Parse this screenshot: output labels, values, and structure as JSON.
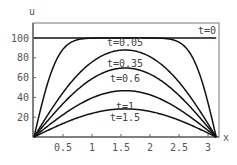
{
  "chart_data": {
    "type": "line",
    "title": "",
    "xlabel": "x",
    "ylabel": "u",
    "xlim": [
      0,
      3.14159
    ],
    "ylim": [
      0,
      113
    ],
    "x_ticks": [
      0.5,
      1,
      1.5,
      2,
      2.5,
      3
    ],
    "x_tick_labels": [
      "0.5",
      "1",
      "1.5",
      "2",
      "2.5",
      "3"
    ],
    "y_ticks": [
      20,
      40,
      60,
      80,
      100
    ],
    "y_tick_labels": [
      "20",
      "40",
      "60",
      "80",
      "100"
    ],
    "grid": false,
    "model": "u(x,t) = (400/pi) * sum over odd n of sin(n x) exp(-n^2 t) / n",
    "initial_value": 100,
    "series": [
      {
        "name": "t=0",
        "t": 0,
        "label": "t=0",
        "peak": 100
      },
      {
        "name": "t=0.05",
        "t": 0.05,
        "label": "t=0.05",
        "peak": 100
      },
      {
        "name": "t=0.35",
        "t": 0.35,
        "label": "t=0.35",
        "peak": 88
      },
      {
        "name": "t=0.6",
        "t": 0.6,
        "label": "t=0.6",
        "peak": 70
      },
      {
        "name": "t=1",
        "t": 1,
        "label": "t=1",
        "peak": 47
      },
      {
        "name": "t=1.5",
        "t": 1.5,
        "label": "t=1.5",
        "peak": 28
      }
    ]
  }
}
